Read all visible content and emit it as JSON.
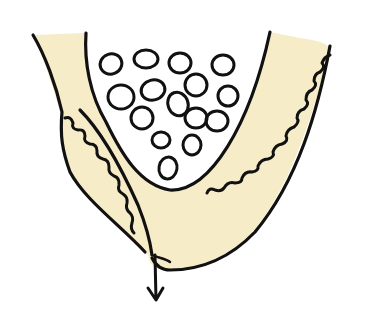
{
  "diagram": {
    "type": "hand-drawn cross-section illustration",
    "description": "Cup-shaped tissue layer containing a cluster of round cells, with a duct on the left leading to a downward arrow",
    "colors": {
      "fill": "#f7ecc8",
      "stroke": "#111111",
      "background": "#ffffff",
      "cavity": "#ffffff"
    },
    "elements": {
      "cell_count": 18,
      "arrow_direction": "down"
    }
  }
}
